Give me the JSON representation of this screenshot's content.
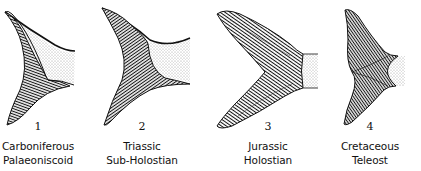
{
  "figure": {
    "panels": [
      {
        "number": "1",
        "period": "Carboniferous",
        "group": "Palaeoniscoid",
        "center_x": 38
      },
      {
        "number": "2",
        "period": "Triassic",
        "group": "Sub-Holostian",
        "center_x": 142
      },
      {
        "number": "3",
        "period": "Jurassic",
        "group": "Holostian",
        "center_x": 268
      },
      {
        "number": "4",
        "period": "Cretaceous",
        "group": "Teleost",
        "center_x": 370
      }
    ],
    "colors": {
      "ink": "#111111",
      "stipple": "#c8c8c8",
      "background": "#ffffff"
    }
  }
}
